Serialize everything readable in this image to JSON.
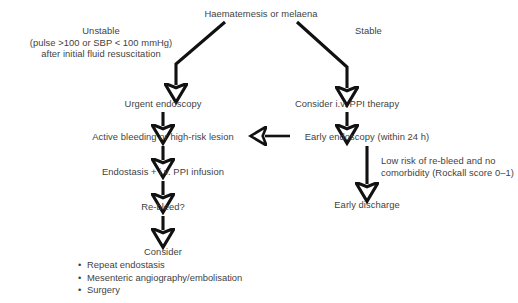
{
  "diagram": {
    "title_node": "Haematemesis or melaena",
    "branch_labels": {
      "left": "Unstable",
      "left_detail_line1": "(pulse >100 or SBP < 100 mmHg)",
      "left_detail_line2": "after initial fluid resuscitation",
      "right": "Stable"
    },
    "nodes": {
      "urgent_endoscopy": "Urgent endoscopy",
      "active_bleeding": "Active bleeding or high-risk lesion",
      "endostasis": "Endostasis + i.v. PPI infusion",
      "rebleed": "Re-bleed?",
      "consider": "Consider",
      "consider_ppi": "Consider i.v. PPI therapy",
      "early_endoscopy": "Early endoscopy (within 24 h)",
      "early_discharge": "Early discharge"
    },
    "annotations": {
      "low_risk_line1": "Low risk of re-bleed and no",
      "low_risk_line2": "comorbidity (Rockall score 0–1)"
    },
    "consider_options": [
      "Repeat endostasis",
      "Mesenteric angiography/embolisation",
      "Surgery"
    ],
    "bullet_glyph": "•",
    "colors": {
      "background": "#ffffff",
      "text": "#3f3f3f",
      "edge": "#111111"
    }
  }
}
